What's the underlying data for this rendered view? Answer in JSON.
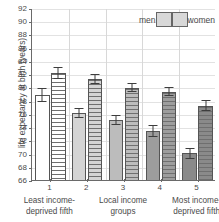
{
  "chart_data": {
    "type": "bar",
    "title": "",
    "xlabel": "",
    "ylabel": "life expectancy at birth (years)",
    "ylim": [
      66,
      92
    ],
    "ytick_step": 2,
    "yticks": [
      66,
      68,
      70,
      72,
      74,
      76,
      78,
      80,
      82,
      84,
      86,
      88,
      90,
      92
    ],
    "grid": true,
    "legend_position": "top-right",
    "categories": [
      "1",
      "2",
      "3",
      "4",
      "5"
    ],
    "category_labels": [
      "Least income-deprived fifth",
      "Local income groups",
      "Most income-deprived fifth"
    ],
    "series": [
      {
        "name": "men",
        "values": [
          79.0,
          76.3,
          75.2,
          73.5,
          70.2
        ],
        "errors": [
          1.0,
          0.8,
          0.8,
          0.9,
          0.8
        ]
      },
      {
        "name": "women",
        "values": [
          82.3,
          81.4,
          80.1,
          79.5,
          77.4
        ],
        "errors": [
          0.9,
          0.8,
          0.7,
          0.7,
          0.8
        ]
      }
    ],
    "group_fills": [
      "#ffffff",
      "#d4d4d4",
      "#bcbcbc",
      "#9d9d9d",
      "#8a8a8a"
    ]
  },
  "axis": {
    "y_title": "life expectancy at birth (years)",
    "y_tick_labels": [
      "92",
      "90",
      "88",
      "86",
      "84",
      "82",
      "80",
      "78",
      "76",
      "74",
      "72",
      "70",
      "68",
      "66"
    ],
    "x_tick_labels": [
      "1",
      "2",
      "3",
      "4",
      "5"
    ],
    "x_category_line1": [
      "Least income-",
      "Local income",
      "Most income-"
    ],
    "x_category_line2": [
      "deprived fifth",
      "groups",
      "deprived fifth"
    ]
  },
  "legend": {
    "men_label": "men",
    "women_label": "women"
  },
  "colors": {
    "axis": "#6a6a6a",
    "grid": "#e2e2e2",
    "text": "#4a4a4a",
    "error_bar": "#3d3d3d",
    "stripe": "#6f6f6f"
  }
}
